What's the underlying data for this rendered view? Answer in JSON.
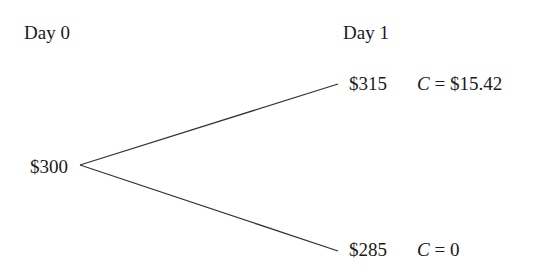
{
  "headers": {
    "day0": "Day 0",
    "day1": "Day 1"
  },
  "nodes": {
    "root": {
      "price": "$300"
    },
    "up": {
      "price": "$315",
      "option_var": "C",
      "option_eq": " = $15.42"
    },
    "down": {
      "price": "$285",
      "option_var": "C",
      "option_eq": " = 0"
    }
  },
  "colors": {
    "line": "#333333",
    "text": "#1a1a1a"
  }
}
